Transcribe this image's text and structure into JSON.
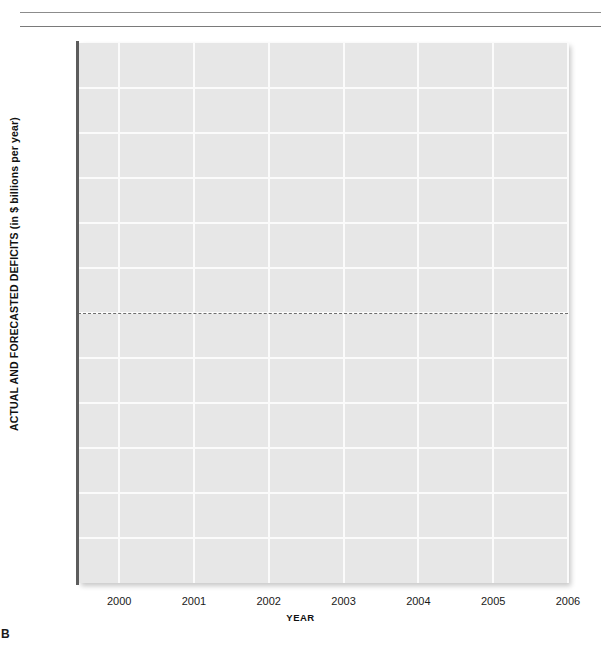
{
  "page": {
    "panel_label": "B",
    "background_color": "#ffffff"
  },
  "rules": [
    {
      "name": "top-rule-upper",
      "color": "#8c8c8c"
    },
    {
      "name": "top-rule-lower",
      "color": "#7a7a7a"
    }
  ],
  "chart_data": {
    "type": "line",
    "title": "",
    "subtitle": "",
    "xlabel": "YEAR",
    "ylabel": "ACTUAL AND FORECASTED DEFICITS (in $ billions per year)",
    "x": [
      2000,
      2001,
      2002,
      2003,
      2004,
      2005,
      2006
    ],
    "xtick_labels": [
      "2000",
      "2001",
      "2002",
      "2003",
      "2004",
      "2005",
      "2006"
    ],
    "xlim": [
      1999.45,
      2006.0
    ],
    "ylim": [
      -300,
      300
    ],
    "ytick_values": [
      300,
      250,
      200,
      150,
      100,
      50,
      0,
      -50,
      -100,
      -150,
      -200,
      -250
    ],
    "ytick_labels": [
      "+300",
      "+250",
      "+200",
      "+150",
      "+100",
      "+50",
      "0",
      "−50",
      "−100",
      "−150",
      "−200",
      "−250"
    ],
    "series": [],
    "grid": true,
    "grid_color": "#fbfbfb",
    "plot_background": "#e7e7e7",
    "legend": null,
    "annotations": [
      {
        "name": "zero-reference-line",
        "type": "horizontal-dashed-line",
        "value": 0,
        "color": "#6e6e6e"
      }
    ],
    "note": "Blank chart template: axes, gridlines and zero reference line only; no data series plotted."
  }
}
